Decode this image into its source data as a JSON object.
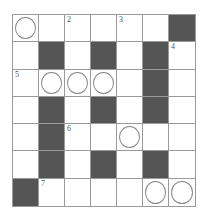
{
  "puzzle": {
    "rows": 7,
    "cols": 7,
    "colors": {
      "black": "#555555",
      "white": "#ffffff",
      "grid_line": "#9a9a9a",
      "circle": "#888888"
    },
    "grid": [
      [
        {
          "t": "W",
          "circle": true
        },
        {
          "t": "W"
        },
        {
          "t": "W",
          "num": "2"
        },
        {
          "t": "W"
        },
        {
          "t": "W",
          "num": "3"
        },
        {
          "t": "W"
        },
        {
          "t": "B"
        }
      ],
      [
        {
          "t": "W"
        },
        {
          "t": "B"
        },
        {
          "t": "W"
        },
        {
          "t": "B"
        },
        {
          "t": "W"
        },
        {
          "t": "B"
        },
        {
          "t": "W",
          "num": "4"
        }
      ],
      [
        {
          "t": "W",
          "num": "5"
        },
        {
          "t": "W",
          "circle": true
        },
        {
          "t": "W",
          "circle": true
        },
        {
          "t": "W",
          "circle": true
        },
        {
          "t": "W"
        },
        {
          "t": "B"
        },
        {
          "t": "W"
        }
      ],
      [
        {
          "t": "W"
        },
        {
          "t": "B"
        },
        {
          "t": "W"
        },
        {
          "t": "B"
        },
        {
          "t": "W"
        },
        {
          "t": "B"
        },
        {
          "t": "W"
        }
      ],
      [
        {
          "t": "W"
        },
        {
          "t": "B"
        },
        {
          "t": "W",
          "num": "6"
        },
        {
          "t": "W"
        },
        {
          "t": "W",
          "circle": true
        },
        {
          "t": "W"
        },
        {
          "t": "W"
        }
      ],
      [
        {
          "t": "W"
        },
        {
          "t": "B"
        },
        {
          "t": "W"
        },
        {
          "t": "B"
        },
        {
          "t": "W"
        },
        {
          "t": "B"
        },
        {
          "t": "W"
        }
      ],
      [
        {
          "t": "B"
        },
        {
          "t": "W",
          "num": "7"
        },
        {
          "t": "W"
        },
        {
          "t": "W"
        },
        {
          "t": "W"
        },
        {
          "t": "W",
          "circle": true
        },
        {
          "t": "W",
          "circle": true
        }
      ]
    ]
  }
}
